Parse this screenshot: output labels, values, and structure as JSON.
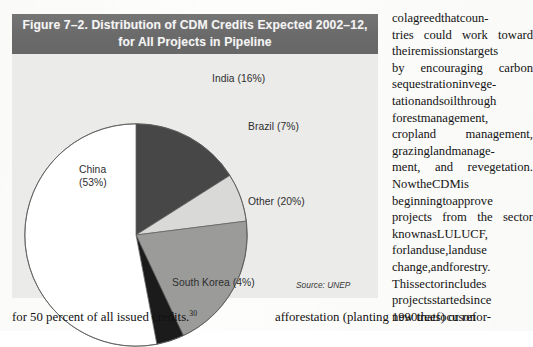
{
  "figure": {
    "title_line1": "Figure 7–2. Distribution of CDM Credits Expected 2002–12,",
    "title_line2": "for All Projects in Pipeline",
    "source": "Source: UNEP",
    "banner_color": "#6d6d6d",
    "panel_color": "#ebebea",
    "labels": {
      "india": "India (16%)",
      "brazil": "Brazil (7%)",
      "other": "Other (20%)",
      "south_korea": "South Korea (4%)",
      "china_line1": "China",
      "china_line2": "(53%)"
    }
  },
  "chart_data": {
    "type": "pie",
    "title": "Figure 7–2. Distribution of CDM Credits Expected 2002–12, for All Projects in Pipeline",
    "subtitle": "",
    "xlabel": "",
    "ylabel": "",
    "source": "Source: UNEP",
    "legend_position": "callout-labels",
    "grid": false,
    "start_angle_deg": 0,
    "direction": "clockwise",
    "categories": [
      "India",
      "Brazil",
      "Other",
      "South Korea",
      "China"
    ],
    "values": [
      16,
      7,
      20,
      4,
      53
    ],
    "value_unit": "percent",
    "slice_colors": [
      "#474747",
      "#d9d9d8",
      "#9b9b9a",
      "#1b1b1b",
      "#ffffff"
    ],
    "slice_labels": [
      "India (16%)",
      "Brazil (7%)",
      "Other (20%)",
      "South Korea (4%)",
      "China (53%)"
    ],
    "series": [
      {
        "name": "Distribution of CDM credits expected 2002–12",
        "values": [
          16,
          7,
          20,
          4,
          53
        ]
      }
    ]
  },
  "body": {
    "right_column_lines": [
      "col agreed that coun-",
      "tries could work toward",
      "their emissions targets",
      "by encouraging carbon",
      "sequestration in vege-",
      "tation and soil through",
      "forest management,",
      "cropland management,",
      "grazing land manage-",
      "ment, and revegetation.",
      "Now the CDM is",
      "beginning to approve",
      "projects from the sector",
      "known as LULUCF,",
      "for land use, land use",
      "change, and forestry.",
      "This sector includes",
      "projects started since",
      "1990 that focus on"
    ],
    "left_last_line_text": "for 50 percent of all issued credits.",
    "left_last_line_footnote": "30",
    "right_last_line": "afforestation (planting new trees) or refor-"
  }
}
